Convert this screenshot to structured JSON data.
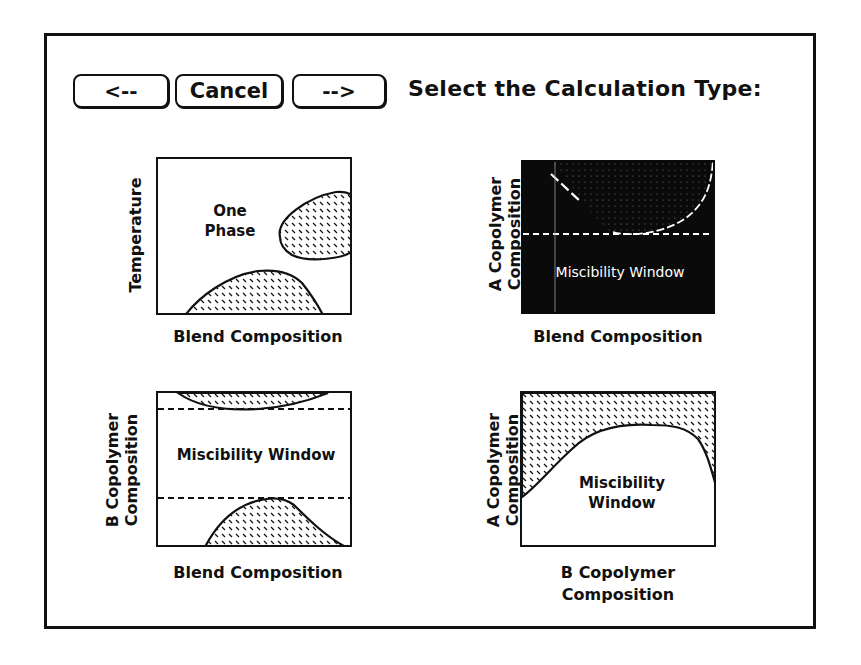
{
  "toolbar": {
    "back_label": "<--",
    "cancel_label": "Cancel",
    "next_label": "-->"
  },
  "header": {
    "title": "Select the Calculation Type:"
  },
  "options": [
    {
      "id": "temperature-blend",
      "ylabel": "Temperature",
      "xlabel": "Blend Composition",
      "inner_text_line1": "One",
      "inner_text_line2": "Phase",
      "selected": false
    },
    {
      "id": "a-copolymer-blend",
      "ylabel_line1": "A Copolymer",
      "ylabel_line2": "Composition",
      "xlabel": "Blend Composition",
      "inner_text": "Miscibility Window",
      "selected": true
    },
    {
      "id": "b-copolymer-blend",
      "ylabel_line1": "B Copolymer",
      "ylabel_line2": "Composition",
      "xlabel": "Blend Composition",
      "inner_text": "Miscibility Window",
      "selected": false
    },
    {
      "id": "a-vs-b-copolymer",
      "ylabel_line1": "A Copolymer",
      "ylabel_line2": "Composition",
      "xlabel_line1": "B Copolymer",
      "xlabel_line2": "Composition",
      "inner_text_line1": "Miscibility",
      "inner_text_line2": "Window",
      "selected": false
    }
  ],
  "colors": {
    "ink": "#111111",
    "paper": "#ffffff",
    "selected_fill": "#0a0a0a"
  }
}
